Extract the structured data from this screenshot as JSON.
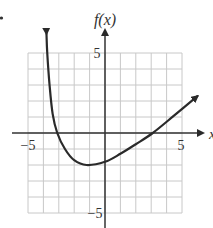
{
  "chart_data": {
    "type": "line",
    "title": "",
    "xlabel": "x",
    "ylabel": "f(x)",
    "xlim": [
      -5,
      5
    ],
    "ylim": [
      -5,
      5
    ],
    "grid": true,
    "grid_step": 1,
    "x_tick_labels": [
      {
        "value": -5,
        "label": "−5"
      },
      {
        "value": 5,
        "label": "5"
      }
    ],
    "y_tick_labels": [
      {
        "value": 5,
        "label": "5"
      },
      {
        "value": -5,
        "label": "−5"
      }
    ],
    "series": [
      {
        "name": "f(x)",
        "arrows_both_ends": true,
        "x": [
          -3.8,
          -3.75,
          -3.6,
          -3.4,
          -3.1,
          -2.6,
          -2.0,
          -1.2,
          0,
          1,
          2,
          3.1,
          4.5,
          6.0
        ],
        "y": [
          6.2,
          5.0,
          3.0,
          1.2,
          0,
          -1.0,
          -1.7,
          -2.0,
          -1.8,
          -1.3,
          -0.7,
          0,
          1.1,
          2.3
        ]
      }
    ],
    "key_points": {
      "x_intercepts": [
        -3.1,
        3.1
      ],
      "y_intercept": -1.8,
      "minimum": {
        "x": -1.2,
        "y": -2.0
      }
    }
  },
  "labels": {
    "y_axis": "f(x)",
    "x_axis": "x",
    "x_min": "−5",
    "x_max": "5",
    "y_max": "5",
    "y_min": "−5"
  },
  "colors": {
    "grid": "#c8c8c8",
    "axis": "#333333",
    "curve": "#2a2a2a"
  }
}
